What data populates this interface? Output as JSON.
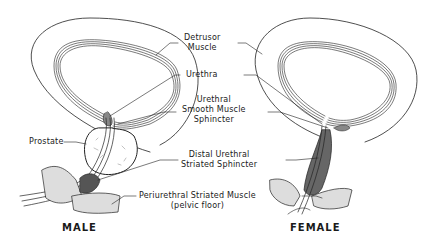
{
  "figure": {
    "labels": {
      "detrusor_1": "Detrusor",
      "detrusor_2": "Muscle",
      "urethra": "Urethra",
      "smooth_1": "Urethral",
      "smooth_2": "Smooth Muscle",
      "smooth_3": "Sphincter",
      "prostate": "Prostate",
      "distal_1": "Distal Urethral",
      "distal_2": "Striated Sphincter",
      "periurethral_1": "Periurethral Striated Muscle",
      "periurethral_2": "(pelvic floor)"
    },
    "captions": {
      "male": "MALE",
      "female": "FEMALE"
    }
  }
}
